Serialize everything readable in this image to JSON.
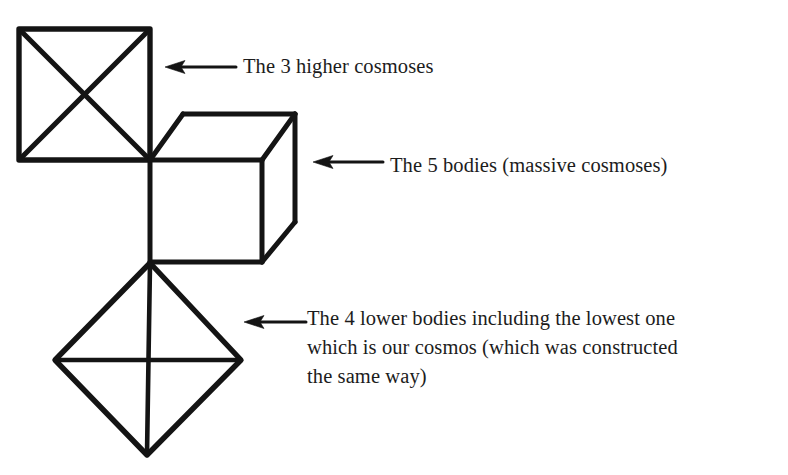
{
  "document": {
    "type": "line-diagram",
    "background_color": "#ffffff",
    "ink_color": "#141414"
  },
  "figure": {
    "name": "ray-of-creation-cosmoses-diagram",
    "shapes": [
      {
        "name": "square-with-diagonals",
        "semantic": "the-3-higher-cosmoses",
        "kind": "square",
        "corners": [
          [
            19,
            29
          ],
          [
            150,
            29
          ],
          [
            150,
            160
          ],
          [
            19,
            160
          ]
        ],
        "internal_lines": "both-diagonals"
      },
      {
        "name": "cube",
        "semantic": "the-5-bodies",
        "kind": "wireframe-cube",
        "front_face": [
          [
            150,
            160
          ],
          [
            262,
            160
          ],
          [
            262,
            262
          ],
          [
            150,
            262
          ]
        ],
        "back_top_left": [
          183,
          114
        ],
        "back_top_right": [
          295,
          114
        ],
        "back_bottom_right": [
          295,
          222
        ]
      },
      {
        "name": "diamond-octahedron",
        "semantic": "the-4-lower-bodies",
        "kind": "diamond",
        "vertices": {
          "top": [
            150,
            263
          ],
          "left": [
            55,
            360
          ],
          "right": [
            241,
            360
          ],
          "bottom": [
            147,
            455
          ]
        },
        "internal_lines": "horizontal-and-vertical-cross"
      }
    ],
    "arrows": [
      {
        "name": "arrow-to-square",
        "direction": "left",
        "tail": [
          236,
          67
        ],
        "head": [
          166,
          67
        ]
      },
      {
        "name": "arrow-to-cube",
        "direction": "left",
        "tail": [
          383,
          162
        ],
        "head": [
          314,
          162
        ]
      },
      {
        "name": "arrow-to-diamond",
        "direction": "left",
        "tail": [
          305,
          322
        ],
        "head": [
          245,
          322
        ]
      }
    ]
  },
  "labels": {
    "higher_cosmoses": "The 3 higher cosmoses",
    "five_bodies": "The 5 bodies (massive cosmoses)",
    "lower_bodies_line1": "The 4 lower bodies including the lowest one",
    "lower_bodies_line2": "which is our cosmos (which was constructed",
    "lower_bodies_line3": "the same way)"
  }
}
